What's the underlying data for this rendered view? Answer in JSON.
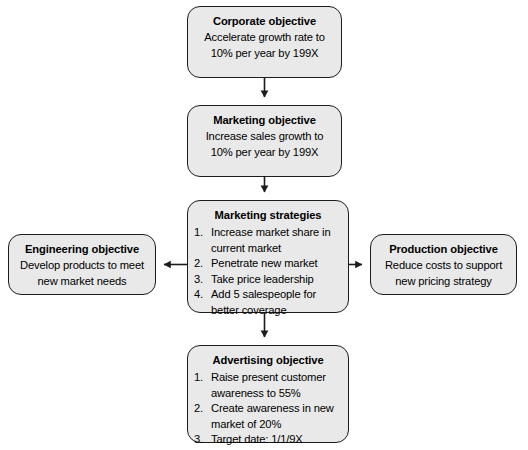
{
  "diagram": {
    "type": "flowchart",
    "background_color": "#ffffff",
    "node_fill_color": "#e9e9e9",
    "node_border_color": "#1c1c1c",
    "nodes": {
      "corporate": {
        "title": "Corporate objective",
        "lines": [
          "Accelerate growth rate to",
          "10% per year by 199X"
        ]
      },
      "marketing_objective": {
        "title": "Marketing objective",
        "lines": [
          "Increase sales growth to",
          "10% per year by 199X"
        ]
      },
      "marketing_strategies": {
        "title": "Marketing strategies",
        "items": [
          {
            "num": "1.",
            "text": "Increase market share in current market"
          },
          {
            "num": "2.",
            "text": "Penetrate new market"
          },
          {
            "num": "3.",
            "text": "Take price leadership"
          },
          {
            "num": "4.",
            "text": "Add 5 salespeople for better coverage"
          }
        ]
      },
      "engineering": {
        "title": "Engineering objective",
        "lines": [
          "Develop products to meet",
          "new market needs"
        ]
      },
      "production": {
        "title": "Production objective",
        "lines": [
          "Reduce costs to support",
          "new pricing strategy"
        ]
      },
      "advertising": {
        "title": "Advertising objective",
        "items": [
          {
            "num": "1.",
            "text": "Raise present customer awareness to 55%"
          },
          {
            "num": "2.",
            "text": "Create awareness in new market of 20%"
          },
          {
            "num": "3.",
            "text": "Target date: 1/1/9X"
          }
        ]
      }
    },
    "connectors": [
      {
        "name": "corporate-to-marketing-objective",
        "direction": "down"
      },
      {
        "name": "marketing-objective-to-strategies",
        "direction": "down"
      },
      {
        "name": "strategies-to-engineering",
        "direction": "left"
      },
      {
        "name": "strategies-to-production",
        "direction": "right"
      },
      {
        "name": "strategies-to-advertising",
        "direction": "down"
      }
    ]
  }
}
